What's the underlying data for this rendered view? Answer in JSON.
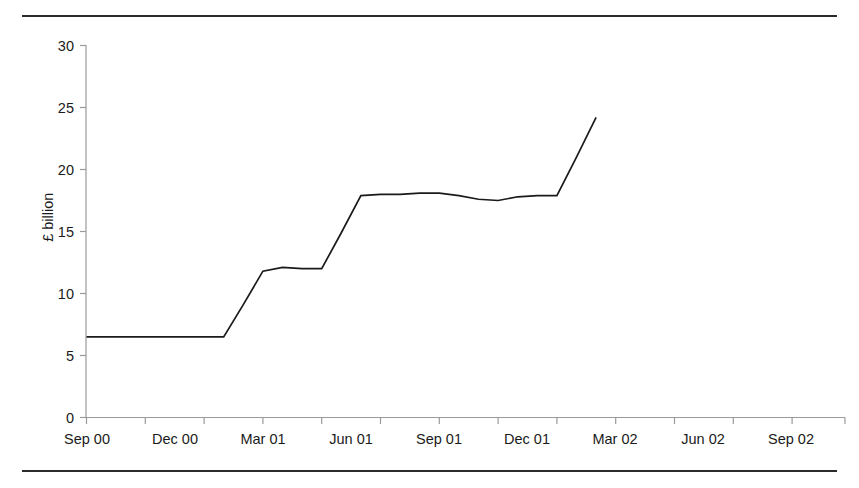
{
  "figure": {
    "title": "",
    "rule_color": "#2b2b2b"
  },
  "axes": {
    "y_axis_title": "£ billion",
    "y_ticks": [
      "0",
      "5",
      "10",
      "15",
      "20",
      "25",
      "30"
    ],
    "x_ticks": [
      "Sep 00",
      "Dec 00",
      "Mar 01",
      "Jun 01",
      "Sep 01",
      "Dec 01",
      "Mar 02",
      "Jun 02",
      "Sep 02"
    ]
  },
  "chart_data": {
    "type": "line",
    "title": "",
    "xlabel": "",
    "ylabel": "£ billion",
    "ylim": [
      0,
      30
    ],
    "ytick_values": [
      0,
      5,
      10,
      15,
      20,
      25,
      30
    ],
    "grid": false,
    "legend": "none",
    "line_color": "#1a1a1a",
    "x_tick_labels": [
      "Sep 00",
      "Dec 00",
      "Mar 01",
      "Jun 01",
      "Sep 01",
      "Dec 01",
      "Mar 02",
      "Jun 02",
      "Sep 02"
    ],
    "x_tick_positions": [
      0,
      3,
      6,
      9,
      12,
      15,
      18,
      21,
      24
    ],
    "x_unit": "month",
    "x": [
      "Sep 00",
      "Oct 00",
      "Nov 00",
      "Dec 00",
      "Jan 01",
      "Feb 01",
      "Mar 01",
      "Apr 01",
      "May 01",
      "Jun 01",
      "Jul 01",
      "Aug 01",
      "Sep 01",
      "Oct 01",
      "Nov 01",
      "Dec 01",
      "Jan 02",
      "Feb 02",
      "Mar 02",
      "Apr 02",
      "May 02",
      "Jun 02",
      "Jul 02",
      "Aug 02",
      "Sep 02",
      "Oct 02",
      "Nov 02"
    ],
    "values": [
      6.5,
      6.5,
      6.5,
      6.5,
      6.5,
      6.5,
      6.5,
      6.5,
      9.1,
      11.8,
      12.1,
      12.0,
      12.0,
      14.9,
      17.9,
      18.0,
      18.0,
      18.1,
      18.1,
      17.9,
      17.6,
      17.5,
      17.8,
      17.9,
      17.9,
      21.0,
      24.2
    ],
    "series_name": "Value"
  }
}
